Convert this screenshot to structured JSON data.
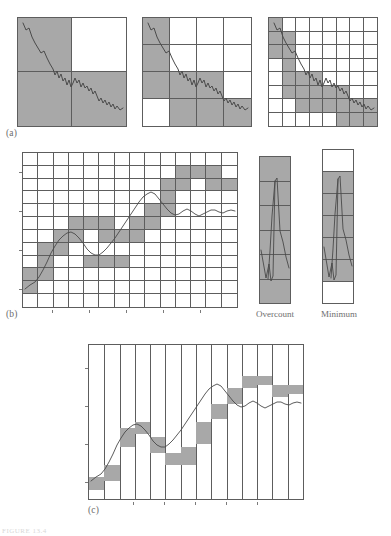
{
  "figure": {
    "panel_labels": {
      "a": "(a)",
      "b": "(b)",
      "c": "(c)"
    },
    "bar_labels": {
      "overcount": "Overcount",
      "minimum": "Minimum"
    },
    "faint_caption": "FIGURE 13.4",
    "colors": {
      "shaded_cell": "#a8a8a8",
      "empty_cell": "#ffffff",
      "grid_line": "#5d5d5d",
      "curve": "#4a4a4a",
      "label_text": "#6b6b6b",
      "page_background": "#ffffff"
    }
  },
  "chart_data": [
    {
      "type": "heatmap",
      "name": "panel-a-grid-1",
      "title": "(a) box counting at scale 1/2",
      "grid_size": [
        2,
        2
      ],
      "legend": [
        "occupied",
        "empty"
      ],
      "occupancy": [
        [
          1,
          0
        ],
        [
          1,
          1
        ]
      ],
      "box_count": 3,
      "notes": "Random-walk trace overlaid; cells touched by the trace are shaded."
    },
    {
      "type": "heatmap",
      "name": "panel-a-grid-2",
      "title": "(a) box counting at scale 1/4",
      "grid_size": [
        4,
        4
      ],
      "legend": [
        "occupied",
        "empty"
      ],
      "occupancy": [
        [
          1,
          0,
          0,
          0
        ],
        [
          1,
          0,
          0,
          0
        ],
        [
          1,
          1,
          1,
          0
        ],
        [
          0,
          1,
          1,
          1
        ]
      ],
      "box_count": 9
    },
    {
      "type": "heatmap",
      "name": "panel-a-grid-3",
      "title": "(a) box counting at scale 1/8",
      "grid_size": [
        8,
        8
      ],
      "legend": [
        "occupied",
        "empty"
      ],
      "occupancy": [
        [
          1,
          0,
          0,
          0,
          0,
          0,
          0,
          0
        ],
        [
          1,
          1,
          0,
          0,
          0,
          0,
          0,
          0
        ],
        [
          1,
          1,
          0,
          0,
          0,
          0,
          0,
          0
        ],
        [
          0,
          1,
          0,
          0,
          0,
          0,
          0,
          0
        ],
        [
          0,
          1,
          1,
          1,
          0,
          0,
          0,
          0
        ],
        [
          0,
          1,
          1,
          1,
          1,
          1,
          0,
          0
        ],
        [
          0,
          0,
          1,
          1,
          1,
          1,
          1,
          1
        ],
        [
          0,
          0,
          0,
          0,
          0,
          1,
          1,
          1
        ]
      ],
      "box_count": 28
    },
    {
      "type": "heatmap",
      "name": "panel-b-grid",
      "title": "(b) uniform square grid over a time series",
      "grid_size": [
        12,
        14
      ],
      "legend": [
        "occupied",
        "empty"
      ],
      "xlabel": "",
      "ylabel": "",
      "occupancy": [
        [
          0,
          0,
          0,
          0,
          0,
          0,
          0,
          0,
          0,
          0,
          0,
          0,
          0,
          0
        ],
        [
          0,
          0,
          0,
          0,
          0,
          0,
          0,
          0,
          0,
          0,
          1,
          1,
          1,
          0
        ],
        [
          0,
          0,
          0,
          0,
          0,
          0,
          0,
          0,
          0,
          1,
          1,
          0,
          1,
          1
        ],
        [
          0,
          0,
          0,
          0,
          0,
          0,
          0,
          0,
          0,
          1,
          0,
          0,
          0,
          0
        ],
        [
          0,
          0,
          0,
          0,
          0,
          0,
          0,
          0,
          1,
          1,
          0,
          0,
          0,
          0
        ],
        [
          0,
          0,
          0,
          1,
          1,
          1,
          0,
          1,
          1,
          0,
          0,
          0,
          0,
          0
        ],
        [
          0,
          0,
          1,
          1,
          0,
          1,
          1,
          1,
          0,
          0,
          0,
          0,
          0,
          0
        ],
        [
          0,
          1,
          1,
          0,
          0,
          0,
          0,
          0,
          0,
          0,
          0,
          0,
          0,
          0
        ],
        [
          0,
          1,
          0,
          0,
          1,
          1,
          1,
          0,
          0,
          0,
          0,
          0,
          0,
          0
        ],
        [
          1,
          1,
          0,
          0,
          0,
          0,
          0,
          0,
          0,
          0,
          0,
          0,
          0,
          0
        ],
        [
          1,
          0,
          0,
          0,
          0,
          0,
          0,
          0,
          0,
          0,
          0,
          0,
          0,
          0
        ],
        [
          0,
          0,
          0,
          0,
          0,
          0,
          0,
          0,
          0,
          0,
          0,
          0,
          0,
          0
        ]
      ],
      "box_count": 33
    },
    {
      "type": "bar",
      "name": "overcount-column",
      "title": "Overcount",
      "categories": [
        "c1",
        "c2",
        "c3",
        "c4",
        "c5",
        "c6"
      ],
      "occupancy": [
        1,
        1,
        1,
        1,
        1,
        1
      ],
      "box_count": 6,
      "notes": "Single column of the grid: every cell spanned by the trace is counted, including the offset boxes, giving an overcount."
    },
    {
      "type": "bar",
      "name": "minimum-column",
      "title": "Minimum",
      "categories": [
        "c1",
        "c2",
        "c3",
        "c4",
        "c5",
        "c6",
        "c7"
      ],
      "occupancy": [
        0,
        1,
        1,
        1,
        1,
        1,
        0
      ],
      "box_count": 5,
      "notes": "Same column shifted so the trace spans the fewest possible cells: the minimum box count."
    },
    {
      "type": "bar",
      "name": "panel-c-columns",
      "title": "(c) minimum covering boxes per column",
      "xlabel": "",
      "ylabel": "",
      "n_columns": 14,
      "categories": [
        "1",
        "2",
        "3",
        "4",
        "5",
        "6",
        "7",
        "8",
        "9",
        "10",
        "11",
        "12",
        "13",
        "14"
      ],
      "box_min": [
        0.06,
        0.12,
        0.34,
        0.42,
        0.3,
        0.22,
        0.22,
        0.36,
        0.52,
        0.62,
        0.72,
        0.74,
        0.66,
        0.68
      ],
      "box_max": [
        0.14,
        0.22,
        0.46,
        0.5,
        0.4,
        0.3,
        0.34,
        0.5,
        0.62,
        0.72,
        0.8,
        0.8,
        0.74,
        0.74
      ],
      "notes": "Each shaded rectangle spans the minimum and maximum of the trace inside that column; total height sums to the variation estimate."
    }
  ],
  "walks": {
    "panel_a": "a single descending random-walk trace, identical in all three grids",
    "panel_b": "an S-shaped rising time series with a dip near the middle",
    "panel_c": "same series as panel (b)"
  }
}
